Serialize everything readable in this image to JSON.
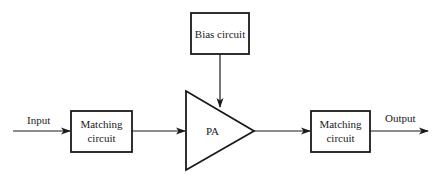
{
  "diagram": {
    "type": "block-diagram",
    "nodes": [
      {
        "id": "input",
        "label": "Input",
        "kind": "terminal-label"
      },
      {
        "id": "match_in",
        "label_line1": "Matching",
        "label_line2": "circuit",
        "kind": "box"
      },
      {
        "id": "bias",
        "label": "Bias circuit",
        "kind": "box"
      },
      {
        "id": "pa",
        "label": "PA",
        "kind": "amplifier-triangle"
      },
      {
        "id": "match_out",
        "label_line1": "Matching",
        "label_line2": "circuit",
        "kind": "box"
      },
      {
        "id": "output",
        "label": "Output",
        "kind": "terminal-label"
      }
    ],
    "edges": [
      {
        "from": "input",
        "to": "match_in"
      },
      {
        "from": "match_in",
        "to": "pa"
      },
      {
        "from": "bias",
        "to": "pa"
      },
      {
        "from": "pa",
        "to": "match_out"
      },
      {
        "from": "match_out",
        "to": "output"
      }
    ]
  },
  "labels": {
    "input": "Input",
    "output": "Output",
    "match_in_1": "Matching",
    "match_in_2": "circuit",
    "match_out_1": "Matching",
    "match_out_2": "circuit",
    "bias": "Bias circuit",
    "pa": "PA"
  },
  "colors": {
    "stroke": "#1a1a1a",
    "background": "#ffffff"
  }
}
